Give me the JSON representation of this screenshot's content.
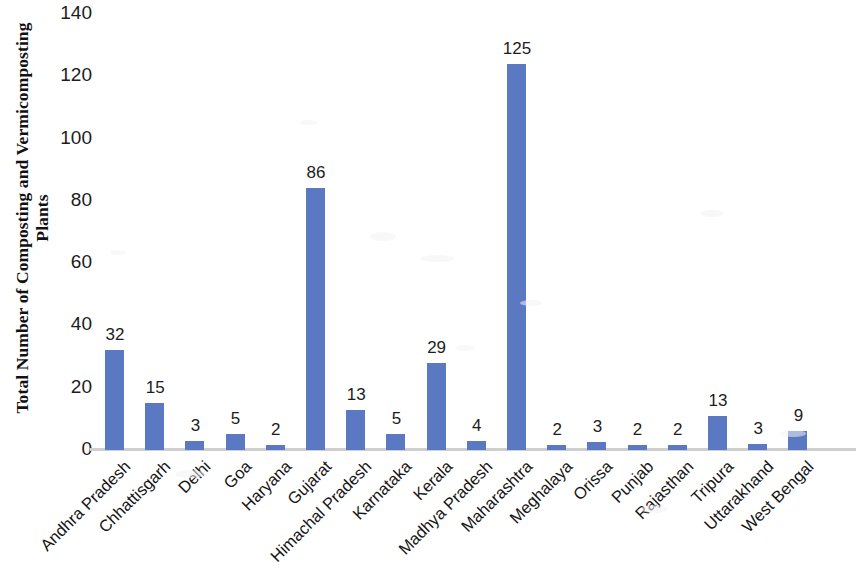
{
  "chart_data": {
    "type": "bar",
    "title": "",
    "xlabel": "",
    "ylabel": "Total Number of Composting and Vermicomposting Plants",
    "ylim": [
      0,
      140
    ],
    "ytick_step": 20,
    "yticks": [
      140,
      120,
      100,
      80,
      60,
      40,
      20,
      0
    ],
    "grid": false,
    "legend": false,
    "bar_color": "#5b79c2",
    "baseline_color": "#cfcfcf",
    "show_data_labels": true,
    "categories": [
      "Andhra Pradesh",
      "Chhattisgarh",
      "Delhi",
      "Goa",
      "Haryana",
      "Gujarat",
      "Himachal Pradesh",
      "Karnataka",
      "Kerala",
      "Madhya Pradesh",
      "Maharashtra",
      "Meghalaya",
      "Orissa",
      "Punjab",
      "Rajasthan",
      "Tripura",
      "Uttarakhand",
      "West Bengal"
    ],
    "values": [
      32,
      15,
      3,
      5,
      2,
      86,
      13,
      5,
      29,
      4,
      125,
      2,
      3,
      2,
      2,
      13,
      3,
      9
    ],
    "data_labels": [
      "32",
      "15",
      "3",
      "5",
      "2",
      "86",
      "13",
      "5",
      "29",
      "4",
      "125",
      "2",
      "3",
      "2",
      "2",
      "13",
      "3",
      "9"
    ],
    "drawn_bar_heights": [
      32,
      15,
      3,
      5,
      1.5,
      84,
      13,
      5,
      28,
      3,
      124,
      1.5,
      2.5,
      1.5,
      1.5,
      11,
      2,
      6
    ]
  }
}
